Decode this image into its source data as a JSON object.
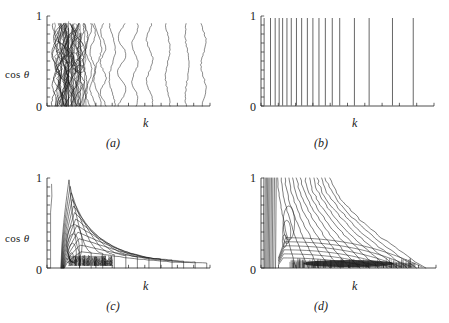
{
  "figure": {
    "background": "#ffffff",
    "ink": "#1a1a1a",
    "panel_count": 4
  },
  "axes": {
    "ylabel": "cos",
    "ylabel_symbol": "θ",
    "xlabel": "k",
    "ytick_top": "1",
    "ytick_bottom": "0"
  },
  "panels": [
    {
      "id": "a",
      "label": "(a)"
    },
    {
      "id": "b",
      "label": "(b)"
    },
    {
      "id": "c",
      "label": "(c)"
    },
    {
      "id": "d",
      "label": "(d)"
    }
  ],
  "chart_data": [
    {
      "type": "line",
      "id": "a",
      "title": "(a)",
      "xlabel": "k",
      "ylabel": "cos θ",
      "ylim": [
        0,
        1
      ],
      "xlim": [
        0,
        1
      ],
      "ytick_labels": [
        "0",
        "1"
      ],
      "grid": false,
      "legend": false,
      "description": "Contour plot: near-vertical wavy contour lines, densely packed near small k and spreading apart toward large k",
      "contours_x_positions": [
        0.045,
        0.055,
        0.065,
        0.075,
        0.082,
        0.09,
        0.1,
        0.108,
        0.115,
        0.125,
        0.135,
        0.145,
        0.155,
        0.17,
        0.185,
        0.2,
        0.215,
        0.235,
        0.255,
        0.28,
        0.31,
        0.345,
        0.4,
        0.46,
        0.54,
        0.63,
        0.74,
        0.86,
        0.96
      ],
      "waviness": 0.022
    },
    {
      "type": "line",
      "id": "b",
      "title": "(b)",
      "xlabel": "k",
      "ylabel": "cos θ",
      "ylim": [
        0,
        1
      ],
      "xlim": [
        0,
        1
      ],
      "ytick_labels": [
        "0",
        "1"
      ],
      "grid": false,
      "legend": false,
      "description": "Contour plot: perfectly straight vertical contour lines with monotonically increasing spacing toward large k",
      "contours_x_positions": [
        0.018,
        0.055,
        0.082,
        0.105,
        0.125,
        0.15,
        0.175,
        0.205,
        0.235,
        0.268,
        0.3,
        0.335,
        0.372,
        0.412,
        0.455,
        0.54,
        0.625,
        0.76,
        0.88
      ],
      "waviness": 0.0
    },
    {
      "type": "line",
      "id": "c",
      "title": "(c)",
      "xlabel": "k",
      "ylabel": "cos θ",
      "ylim": [
        0,
        1
      ],
      "xlim": [
        0,
        1
      ],
      "ytick_labels": [
        "0",
        "1"
      ],
      "grid": false,
      "legend": false,
      "description": "Contour plot: nested contours rising near small k then decaying with long tails toward large k; very dense dark cluster along cos theta near 0.05-0.15 at small k",
      "peak_k": 0.16,
      "tail_extent": 0.98,
      "dense_blob": {
        "x0": 0.12,
        "x1": 0.4,
        "y0": 0.03,
        "y1": 0.14
      }
    },
    {
      "type": "line",
      "id": "d",
      "title": "(d)",
      "xlabel": "k",
      "ylabel": "cos θ",
      "ylim": [
        0,
        1
      ],
      "xlim": [
        0,
        1
      ],
      "ytick_labels": [
        "0",
        "1"
      ],
      "grid": false,
      "legend": false,
      "description": "Contour plot: contours bunched at small k along the full cos theta range, fanning out and descending toward lower right; dark dense blob along the bottom from k about 0.25 to 0.75",
      "dense_blob": {
        "x0": 0.22,
        "x1": 0.78,
        "y0": 0.01,
        "y1": 0.09
      }
    }
  ]
}
